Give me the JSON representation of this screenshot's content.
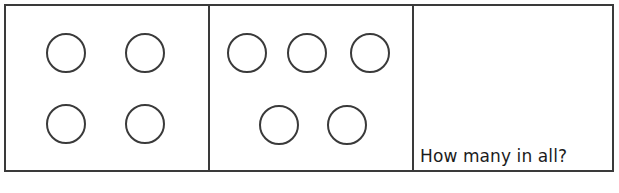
{
  "worksheet": {
    "type": "counting-addition-worksheet",
    "panel_count": 3,
    "colors": {
      "stroke": "#3a3a3a",
      "background": "#ffffff",
      "text": "#1c1c1c"
    },
    "panels": [
      {
        "id": "panel-1",
        "name": "first-addend-group",
        "circle_count": 4,
        "rows": [
          {
            "count": 2,
            "circles": [
              {
                "x": 40,
                "y": 27
              },
              {
                "x": 119,
                "y": 27
              }
            ]
          },
          {
            "count": 2,
            "circles": [
              {
                "x": 40,
                "y": 98
              },
              {
                "x": 119,
                "y": 98
              }
            ]
          }
        ]
      },
      {
        "id": "panel-2",
        "name": "second-addend-group",
        "circle_count": 5,
        "rows": [
          {
            "count": 3,
            "circles": [
              {
                "x": 17,
                "y": 27
              },
              {
                "x": 77,
                "y": 27
              },
              {
                "x": 140,
                "y": 27
              }
            ]
          },
          {
            "count": 2,
            "circles": [
              {
                "x": 49,
                "y": 99
              },
              {
                "x": 117,
                "y": 99
              }
            ]
          }
        ]
      },
      {
        "id": "panel-3",
        "name": "answer-panel",
        "circle_count": 0,
        "rows": [],
        "prompt": "How many in all?"
      }
    ]
  }
}
